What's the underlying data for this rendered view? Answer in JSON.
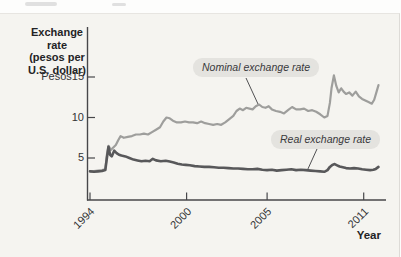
{
  "figure": {
    "panel_bg": "#f5f4f0",
    "axis_color": "#47474a",
    "nominal_line_color": "#9e9e9c",
    "real_line_color": "#58585a"
  },
  "chart_data": {
    "type": "line",
    "title": "",
    "grid": false,
    "legend": "inline-callout-labels",
    "x_axis": {
      "label": "Year",
      "ticks": [
        "1994",
        "2000",
        "2005",
        "2011"
      ],
      "tick_years": [
        1994,
        2000,
        2005,
        2011
      ],
      "range_years": [
        1993.8,
        2012.2
      ]
    },
    "y_axis": {
      "label": "Exchange rate (pesos per U.S. dollar)",
      "title_lines": [
        "Exchange rate",
        "(pesos per",
        "U.S. dollar)"
      ],
      "ticks": [
        "Pesos15",
        "10",
        "5"
      ],
      "tick_values": [
        15,
        10,
        5
      ],
      "range": [
        0,
        15.5
      ]
    },
    "annotations": [
      {
        "text": "Nominal exchange rate"
      },
      {
        "text": "Real exchange rate"
      }
    ],
    "series": [
      {
        "name": "Nominal exchange rate",
        "color": "#9e9e9c",
        "width": 2.2,
        "points": [
          [
            1994.0,
            3.4
          ],
          [
            1994.25,
            3.4
          ],
          [
            1994.5,
            3.45
          ],
          [
            1994.75,
            3.5
          ],
          [
            1994.95,
            3.6
          ],
          [
            1995.05,
            5.4
          ],
          [
            1995.15,
            6.5
          ],
          [
            1995.3,
            6.0
          ],
          [
            1995.45,
            6.3
          ],
          [
            1995.6,
            6.6
          ],
          [
            1995.75,
            7.2
          ],
          [
            1995.9,
            7.7
          ],
          [
            1996.1,
            7.5
          ],
          [
            1996.35,
            7.6
          ],
          [
            1996.6,
            7.7
          ],
          [
            1996.85,
            7.9
          ],
          [
            1997.1,
            7.9
          ],
          [
            1997.35,
            8.0
          ],
          [
            1997.6,
            7.9
          ],
          [
            1997.85,
            8.2
          ],
          [
            1998.1,
            8.5
          ],
          [
            1998.35,
            8.8
          ],
          [
            1998.55,
            9.5
          ],
          [
            1998.75,
            10.0
          ],
          [
            1998.95,
            9.9
          ],
          [
            1999.15,
            9.6
          ],
          [
            1999.4,
            9.4
          ],
          [
            1999.65,
            9.4
          ],
          [
            1999.9,
            9.5
          ],
          [
            2000.15,
            9.4
          ],
          [
            2000.4,
            9.4
          ],
          [
            2000.65,
            9.3
          ],
          [
            2000.9,
            9.5
          ],
          [
            2001.15,
            9.3
          ],
          [
            2001.4,
            9.2
          ],
          [
            2001.65,
            9.1
          ],
          [
            2001.9,
            9.2
          ],
          [
            2002.15,
            9.1
          ],
          [
            2002.4,
            9.4
          ],
          [
            2002.65,
            9.8
          ],
          [
            2002.9,
            10.2
          ],
          [
            2003.1,
            10.8
          ],
          [
            2003.3,
            11.1
          ],
          [
            2003.5,
            10.9
          ],
          [
            2003.7,
            11.2
          ],
          [
            2003.9,
            11.1
          ],
          [
            2004.1,
            11.0
          ],
          [
            2004.3,
            11.4
          ],
          [
            2004.5,
            11.6
          ],
          [
            2004.7,
            11.3
          ],
          [
            2004.9,
            11.2
          ],
          [
            2005.1,
            11.4
          ],
          [
            2005.3,
            11.0
          ],
          [
            2005.55,
            10.8
          ],
          [
            2005.8,
            10.7
          ],
          [
            2006.05,
            10.5
          ],
          [
            2006.3,
            10.9
          ],
          [
            2006.55,
            11.3
          ],
          [
            2006.8,
            11.0
          ],
          [
            2007.05,
            11.0
          ],
          [
            2007.3,
            11.1
          ],
          [
            2007.55,
            10.8
          ],
          [
            2007.8,
            10.9
          ],
          [
            2008.05,
            10.7
          ],
          [
            2008.3,
            10.4
          ],
          [
            2008.55,
            10.0
          ],
          [
            2008.75,
            10.2
          ],
          [
            2008.9,
            11.8
          ],
          [
            2009.0,
            13.6
          ],
          [
            2009.15,
            15.2
          ],
          [
            2009.3,
            13.9
          ],
          [
            2009.45,
            13.1
          ],
          [
            2009.6,
            13.6
          ],
          [
            2009.75,
            13.2
          ],
          [
            2009.9,
            12.9
          ],
          [
            2010.1,
            13.1
          ],
          [
            2010.3,
            12.7
          ],
          [
            2010.5,
            13.2
          ],
          [
            2010.7,
            12.6
          ],
          [
            2010.9,
            12.3
          ],
          [
            2011.1,
            12.1
          ],
          [
            2011.3,
            11.9
          ],
          [
            2011.5,
            11.7
          ],
          [
            2011.65,
            12.2
          ],
          [
            2011.8,
            13.2
          ],
          [
            2011.92,
            14.0
          ]
        ]
      },
      {
        "name": "Real exchange rate",
        "color": "#58585a",
        "width": 2.6,
        "points": [
          [
            1994.0,
            3.35
          ],
          [
            1994.25,
            3.3
          ],
          [
            1994.5,
            3.35
          ],
          [
            1994.75,
            3.4
          ],
          [
            1994.95,
            3.5
          ],
          [
            1995.05,
            5.0
          ],
          [
            1995.15,
            6.4
          ],
          [
            1995.25,
            5.4
          ],
          [
            1995.35,
            5.2
          ],
          [
            1995.5,
            5.9
          ],
          [
            1995.65,
            5.6
          ],
          [
            1995.8,
            5.4
          ],
          [
            1995.95,
            5.3
          ],
          [
            1996.2,
            5.2
          ],
          [
            1996.45,
            5.0
          ],
          [
            1996.7,
            4.8
          ],
          [
            1996.95,
            4.7
          ],
          [
            1997.2,
            4.6
          ],
          [
            1997.45,
            4.65
          ],
          [
            1997.7,
            4.6
          ],
          [
            1997.9,
            4.9
          ],
          [
            1998.1,
            4.7
          ],
          [
            1998.4,
            4.6
          ],
          [
            1998.7,
            4.65
          ],
          [
            1998.95,
            4.55
          ],
          [
            1999.2,
            4.45
          ],
          [
            1999.45,
            4.3
          ],
          [
            1999.7,
            4.2
          ],
          [
            1999.95,
            4.15
          ],
          [
            2000.2,
            4.1
          ],
          [
            2000.5,
            4.0
          ],
          [
            2000.8,
            3.95
          ],
          [
            2001.1,
            3.9
          ],
          [
            2001.4,
            3.9
          ],
          [
            2001.7,
            3.85
          ],
          [
            2002.0,
            3.8
          ],
          [
            2002.3,
            3.8
          ],
          [
            2002.6,
            3.75
          ],
          [
            2002.9,
            3.7
          ],
          [
            2003.2,
            3.7
          ],
          [
            2003.5,
            3.65
          ],
          [
            2003.8,
            3.6
          ],
          [
            2004.1,
            3.6
          ],
          [
            2004.4,
            3.65
          ],
          [
            2004.7,
            3.55
          ],
          [
            2005.0,
            3.5
          ],
          [
            2005.3,
            3.55
          ],
          [
            2005.6,
            3.45
          ],
          [
            2005.9,
            3.5
          ],
          [
            2006.2,
            3.55
          ],
          [
            2006.5,
            3.6
          ],
          [
            2006.8,
            3.5
          ],
          [
            2007.1,
            3.55
          ],
          [
            2007.4,
            3.5
          ],
          [
            2007.7,
            3.45
          ],
          [
            2008.0,
            3.4
          ],
          [
            2008.3,
            3.35
          ],
          [
            2008.55,
            3.3
          ],
          [
            2008.75,
            3.5
          ],
          [
            2008.9,
            3.9
          ],
          [
            2009.05,
            4.15
          ],
          [
            2009.2,
            4.25
          ],
          [
            2009.35,
            4.1
          ],
          [
            2009.5,
            3.95
          ],
          [
            2009.7,
            3.85
          ],
          [
            2009.9,
            3.75
          ],
          [
            2010.15,
            3.7
          ],
          [
            2010.4,
            3.75
          ],
          [
            2010.65,
            3.7
          ],
          [
            2010.9,
            3.6
          ],
          [
            2011.15,
            3.55
          ],
          [
            2011.4,
            3.5
          ],
          [
            2011.6,
            3.55
          ],
          [
            2011.75,
            3.65
          ],
          [
            2011.92,
            3.9
          ]
        ]
      }
    ]
  }
}
